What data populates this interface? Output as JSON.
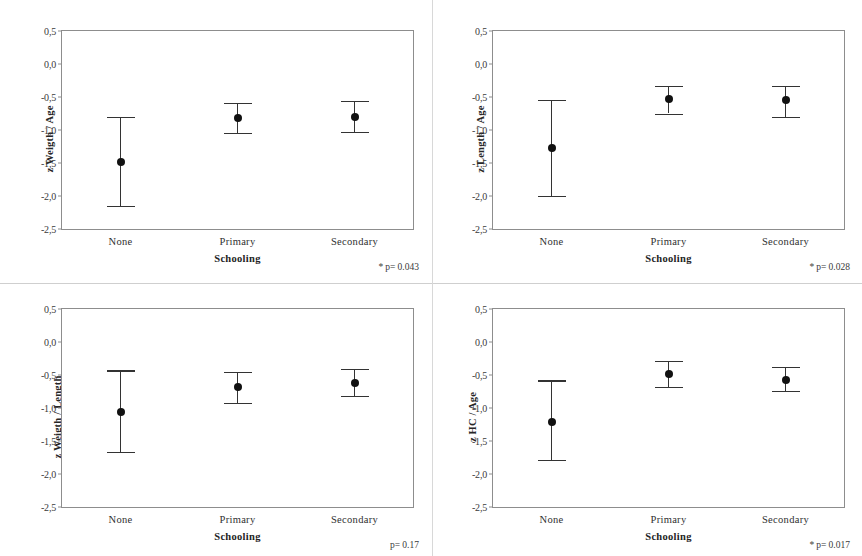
{
  "figure": {
    "type": "error-bar-panels",
    "panel_count": 4,
    "x_categories": [
      "None",
      "Primary",
      "Secondary"
    ],
    "x_axis_title": "Schooling",
    "y_ticks": [
      "0,5",
      "0,0",
      "-0,5",
      "-1,0",
      "-1,5",
      "-2,0",
      "-2,5"
    ],
    "y_tick_values": [
      0.5,
      0.0,
      -0.5,
      -1.0,
      -1.5,
      -2.0,
      -2.5
    ],
    "marker_color": "#111111",
    "line_color": "#333333",
    "frame_color": "#8d8d8d"
  },
  "chart_data": [
    {
      "type": "scatter",
      "panel": "top-left",
      "title": "",
      "xlabel": "Schooling",
      "ylabel": "z Weigth / Age",
      "categories": [
        "None",
        "Primary",
        "Secondary"
      ],
      "values": [
        -1.48,
        -0.82,
        -0.8
      ],
      "ci_lower": [
        -2.15,
        -1.04,
        -1.03
      ],
      "ci_upper": [
        -0.8,
        -0.59,
        -0.56
      ],
      "ylim": [
        -2.5,
        0.5
      ],
      "y_ticks": [
        0.5,
        0.0,
        -0.5,
        -1.0,
        -1.5,
        -2.0,
        -2.5
      ],
      "y_tick_labels": [
        "0,5",
        "0,0",
        "-0,5",
        "-1,0",
        "-1,5",
        "-2,0",
        "-2,5"
      ],
      "grid": false,
      "legend": "none",
      "annotation": "* p= 0.043",
      "annotation_star": "*",
      "annotation_text": "p= 0.043",
      "p_value": 0.043,
      "significant": true
    },
    {
      "type": "scatter",
      "panel": "top-right",
      "title": "",
      "xlabel": "Schooling",
      "ylabel": "z Length / Age",
      "categories": [
        "None",
        "Primary",
        "Secondary"
      ],
      "values": [
        -1.28,
        -0.53,
        -0.55
      ],
      "ci_lower": [
        -2.0,
        -0.75,
        -0.8
      ],
      "ci_upper": [
        -0.54,
        -0.33,
        -0.33
      ],
      "ylim": [
        -2.5,
        0.5
      ],
      "y_ticks": [
        0.5,
        0.0,
        -0.5,
        -1.0,
        -1.5,
        -2.0,
        -2.5
      ],
      "y_tick_labels": [
        "0,5",
        "0,0",
        "-0,5",
        "-1,0",
        "-1,5",
        "-2,0",
        "-2,5"
      ],
      "grid": false,
      "legend": "none",
      "annotation": "* p= 0.028",
      "annotation_star": "*",
      "annotation_text": "p= 0.028",
      "p_value": 0.028,
      "significant": true
    },
    {
      "type": "scatter",
      "panel": "bottom-left",
      "title": "",
      "xlabel": "Schooling",
      "ylabel": "z Weigth / Length",
      "categories": [
        "None",
        "Primary",
        "Secondary"
      ],
      "values": [
        -1.06,
        -0.68,
        -0.62
      ],
      "ci_lower": [
        -1.66,
        -0.92,
        -0.82
      ],
      "ci_upper": [
        -0.43,
        -0.45,
        -0.41
      ],
      "ylim": [
        -2.5,
        0.5
      ],
      "y_ticks": [
        0.5,
        0.0,
        -0.5,
        -1.0,
        -1.5,
        -2.0,
        -2.5
      ],
      "y_tick_labels": [
        "0,5",
        "0,0",
        "-0,5",
        "-1,0",
        "-1,5",
        "-2,0",
        "-2,5"
      ],
      "grid": false,
      "legend": "none",
      "annotation": "p= 0.17",
      "annotation_star": "",
      "annotation_text": "p= 0.17",
      "p_value": 0.17,
      "significant": false
    },
    {
      "type": "scatter",
      "panel": "bottom-right",
      "title": "",
      "xlabel": "Schooling",
      "ylabel": "z HC / Age",
      "categories": [
        "None",
        "Primary",
        "Secondary"
      ],
      "values": [
        -1.21,
        -0.48,
        -0.57
      ],
      "ci_lower": [
        -1.79,
        -0.68,
        -0.74
      ],
      "ci_upper": [
        -0.58,
        -0.29,
        -0.38
      ],
      "ylim": [
        -2.5,
        0.5
      ],
      "y_ticks": [
        0.5,
        0.0,
        -0.5,
        -1.0,
        -1.5,
        -2.0,
        -2.5
      ],
      "y_tick_labels": [
        "0,5",
        "0,0",
        "-0,5",
        "-1,0",
        "-1,5",
        "-2,0",
        "-2,5"
      ],
      "grid": false,
      "legend": "none",
      "annotation": "* p= 0.017",
      "annotation_star": "*",
      "annotation_text": "p= 0.017",
      "p_value": 0.017,
      "significant": true
    }
  ]
}
